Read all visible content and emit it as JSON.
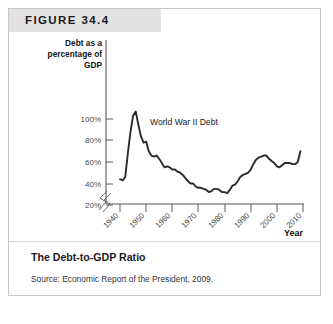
{
  "figure": {
    "banner_label": "FIGURE 34.4",
    "caption_title": "The Debt-to-GDP Ratio",
    "caption_source": "Source: Economic Report of the President, 2009."
  },
  "chart_data": {
    "type": "line",
    "title": "The Debt-to-GDP Ratio",
    "xlabel": "Year",
    "ylabel": "Debt as a percentage of GDP",
    "ylabel_lines": [
      "Debt as a",
      "percentage of",
      "GDP"
    ],
    "xlim": [
      1940,
      2010
    ],
    "ylim": [
      20,
      110
    ],
    "yticks": [
      20,
      40,
      60,
      80,
      100
    ],
    "ytick_labels": [
      "20%",
      "40%",
      "60%",
      "80%",
      "100%"
    ],
    "xticks": [
      1940,
      1950,
      1960,
      1970,
      1980,
      1990,
      2000,
      2010
    ],
    "xtick_labels": [
      "1940",
      "1950",
      "1960",
      "1970",
      "1980",
      "1990",
      "2000",
      "2010"
    ],
    "axis_break": true,
    "grid": false,
    "legend": "none",
    "line_color": "#2b2b2b",
    "annotations": [
      {
        "text": "World War II Debt",
        "x": 1948,
        "y": 104
      }
    ],
    "series": [
      {
        "name": "Debt as a percentage of GDP",
        "x": [
          1940,
          1941,
          1942,
          1943,
          1944,
          1945,
          1946,
          1947,
          1948,
          1949,
          1950,
          1951,
          1952,
          1953,
          1954,
          1955,
          1956,
          1957,
          1958,
          1959,
          1960,
          1961,
          1962,
          1963,
          1964,
          1965,
          1966,
          1967,
          1968,
          1969,
          1970,
          1971,
          1972,
          1973,
          1974,
          1975,
          1976,
          1977,
          1978,
          1979,
          1980,
          1981,
          1982,
          1983,
          1984,
          1985,
          1986,
          1987,
          1988,
          1989,
          1990,
          1991,
          1992,
          1993,
          1994,
          1995,
          1996,
          1997,
          1998,
          1999,
          2000,
          2001,
          2002,
          2003,
          2004,
          2005,
          2006,
          2007,
          2008,
          2009
        ],
        "values": [
          44,
          43,
          46,
          68,
          88,
          103,
          107,
          95,
          84,
          78,
          79,
          70,
          66,
          65,
          66,
          63,
          59,
          55,
          56,
          55,
          53,
          53,
          51,
          50,
          48,
          45,
          42,
          40,
          40,
          37,
          36,
          36,
          35,
          34,
          32,
          33,
          35,
          35,
          34,
          32,
          32,
          31,
          34,
          38,
          39,
          42,
          46,
          48,
          49,
          50,
          53,
          58,
          62,
          64,
          65,
          66,
          66,
          63,
          61,
          59,
          56,
          55,
          57,
          59,
          59,
          59,
          58,
          58,
          60,
          70
        ]
      }
    ]
  }
}
